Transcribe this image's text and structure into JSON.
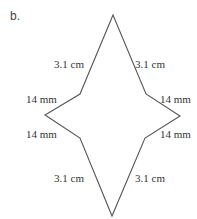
{
  "part_label": "b.",
  "shape": {
    "stroke_color": "#555555",
    "vertices": [
      [
        113,
        15
      ],
      [
        146,
        94
      ],
      [
        180,
        116
      ],
      [
        145,
        138
      ],
      [
        112,
        216
      ],
      [
        80,
        138
      ],
      [
        45,
        115
      ],
      [
        80,
        94
      ]
    ]
  },
  "labels": {
    "upper_left": "3.1 cm",
    "upper_right": "3.1 cm",
    "mid_upper_left": "14 mm",
    "mid_upper_right": "14 mm",
    "mid_lower_left": "14 mm",
    "mid_lower_right": "14 mm",
    "lower_left": "3.1 cm",
    "lower_right": "3.1 cm"
  }
}
